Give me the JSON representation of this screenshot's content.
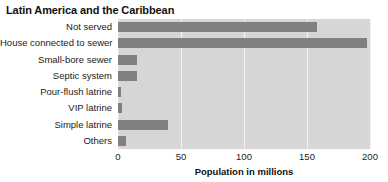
{
  "chart_data": {
    "type": "bar",
    "orientation": "horizontal",
    "title": "Latin America and the Caribbean",
    "xlabel": "Population in millions",
    "ylabel": "",
    "xlim": [
      0,
      200
    ],
    "xticks": [
      0,
      50,
      100,
      150,
      200
    ],
    "xtick_labels": [
      "0",
      "50",
      "100",
      "150",
      "200"
    ],
    "grid": true,
    "grid_axis": "x",
    "legend": false,
    "categories": [
      "Not served",
      "House connected to sewer",
      "Small-bore sewer",
      "Septic system",
      "Pour-flush latrine",
      "VIP latrine",
      "Simple latrine",
      "Others"
    ],
    "values": [
      158,
      198,
      15,
      15,
      2,
      3,
      40,
      6
    ],
    "series": [
      {
        "name": "Population in millions",
        "values": [
          158,
          198,
          15,
          15,
          2,
          3,
          40,
          6
        ]
      }
    ],
    "colors": {
      "bar": "#808080",
      "plot_background": "#d6d6d6",
      "figure_background": "#ffffff",
      "gridline": "#f2f2f2",
      "text": "#1a1a1a"
    }
  }
}
